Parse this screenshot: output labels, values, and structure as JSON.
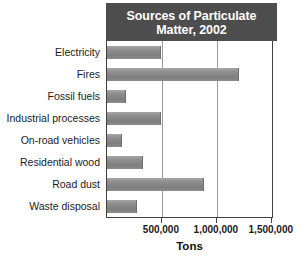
{
  "chart_data": {
    "type": "bar",
    "orientation": "horizontal",
    "title": "Sources of Particulate Matter, 2002",
    "title_line_1": "Sources of Particulate",
    "title_line_2": "Matter, 2002",
    "xlabel": "Tons",
    "ylabel": "",
    "categories": [
      "Electricity",
      "Fires",
      "Fossil fuels",
      "Industrial processes",
      "On-road vehicles",
      "Residential wood",
      "Road dust",
      "Waste disposal"
    ],
    "values": [
      490000,
      1200000,
      170000,
      490000,
      140000,
      330000,
      880000,
      275000
    ],
    "xlim": [
      0,
      1520000
    ],
    "xticks": [
      500000,
      1000000,
      1500000
    ],
    "xticklabels": [
      "500,000",
      "1,000,000",
      "1,500,000"
    ],
    "grid": "vertical",
    "gridlines_at": [
      500000,
      1000000
    ],
    "legend": null,
    "bar_color": "#8f8f8f",
    "title_bg_color": "#4d4d4d",
    "title_text_color": "#ffffff",
    "axis_color": "#404040",
    "gridline_color": "#999999"
  }
}
